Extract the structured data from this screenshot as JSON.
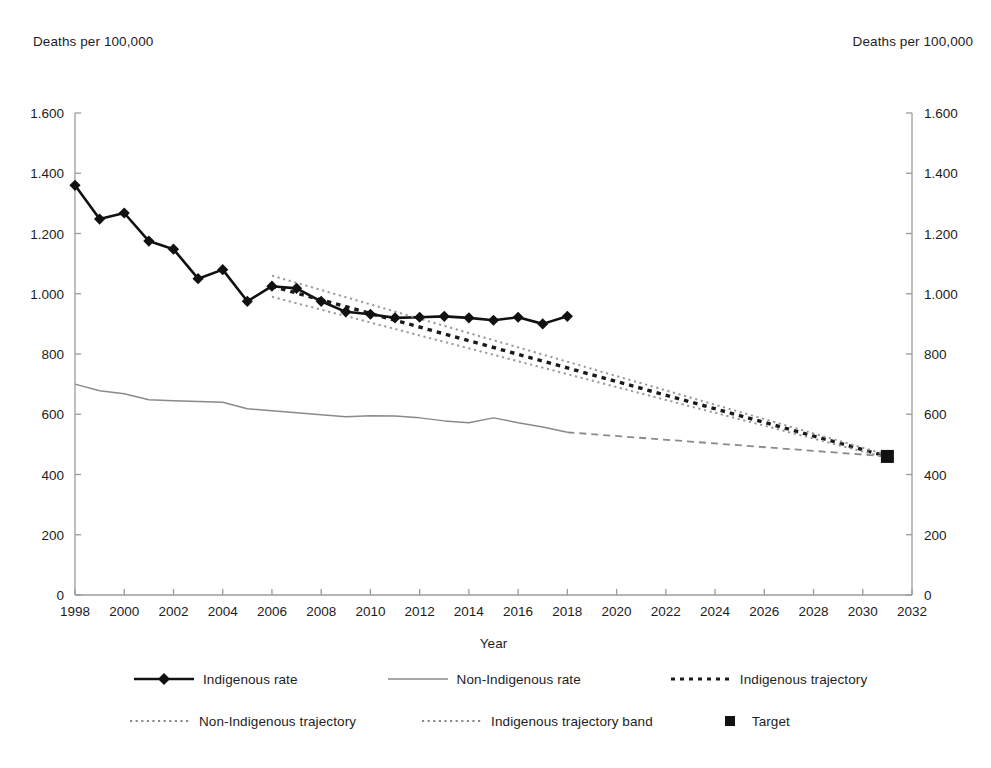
{
  "axis_labels": {
    "left_unit": "Deaths per 100,000",
    "right_unit": "Deaths per 100,000",
    "x_title": "Year"
  },
  "legend": {
    "items": [
      {
        "label": "Indigenous rate",
        "icon": "line-with-diamond-marker",
        "style": "solid-thick-black-diamond"
      },
      {
        "label": "Non-Indigenous rate",
        "icon": "line-gray",
        "style": "solid-thin-gray"
      },
      {
        "label": "Indigenous trajectory",
        "icon": "dashed-line-black",
        "style": "dashed-bold-black"
      },
      {
        "label": "Non-Indigenous trajectory",
        "icon": "dotted-line-gray",
        "style": "dotted-gray"
      },
      {
        "label": "Indigenous trajectory band",
        "icon": "dotted-line-gray",
        "style": "dotted-gray"
      },
      {
        "label": "Target",
        "icon": "square-marker-black",
        "style": "square-black"
      }
    ]
  },
  "colors": {
    "indigenous_rate": "#111111",
    "non_indigenous_rate": "#8a8a8a",
    "indigenous_trajectory": "#1a1a1a",
    "non_indigenous_trajectory": "#8a8a8a",
    "trajectory_band": "#9a9a9a",
    "target": "#111111",
    "axis": "#9b9b9b",
    "text": "#1d1d1d",
    "background": "#ffffff"
  },
  "chart_data": {
    "type": "line",
    "title": "",
    "xlabel": "Year",
    "ylabel": "Deaths per 100,000",
    "ylabel_right": "Deaths per 100,000",
    "xlim": [
      1998,
      2032
    ],
    "ylim": [
      0,
      1600
    ],
    "xticks": [
      1998,
      2000,
      2002,
      2004,
      2006,
      2008,
      2010,
      2012,
      2014,
      2016,
      2018,
      2020,
      2022,
      2024,
      2026,
      2028,
      2030,
      2032
    ],
    "xticklabels": [
      "1998",
      "2000",
      "2002",
      "2004",
      "2006",
      "2008",
      "2010",
      "2012",
      "2014",
      "2016",
      "2018",
      "2020",
      "2022",
      "2024",
      "2026",
      "2028",
      "2030",
      "2032"
    ],
    "yticks": [
      0,
      200,
      400,
      600,
      800,
      1000,
      1200,
      1400,
      1600
    ],
    "yticklabels": [
      "0",
      "200",
      "400",
      "600",
      "800",
      "1.000",
      "1.200",
      "1.400",
      "1.600"
    ],
    "yticklabels_right": [
      "0",
      "200",
      "400",
      "600",
      "800",
      "1.000",
      "1.200",
      "1.400",
      "1.600"
    ],
    "grid": false,
    "legend_position": "below",
    "series": [
      {
        "name": "Indigenous rate",
        "marker": "diamond",
        "linestyle": "solid",
        "color": "#111111",
        "x": [
          1998,
          1999,
          2000,
          2001,
          2002,
          2003,
          2004,
          2005,
          2006,
          2007,
          2008,
          2009,
          2010,
          2011,
          2012,
          2013,
          2014,
          2015,
          2016,
          2017,
          2018
        ],
        "values": [
          1360,
          1248,
          1268,
          1175,
          1148,
          1050,
          1080,
          975,
          1025,
          1018,
          975,
          940,
          932,
          920,
          922,
          925,
          920,
          912,
          922,
          900,
          925
        ]
      },
      {
        "name": "Non-Indigenous rate",
        "marker": "none",
        "linestyle": "solid",
        "color": "#8a8a8a",
        "x": [
          1998,
          1999,
          2000,
          2001,
          2002,
          2003,
          2004,
          2005,
          2006,
          2007,
          2008,
          2009,
          2010,
          2011,
          2012,
          2013,
          2014,
          2015,
          2016,
          2017,
          2018
        ],
        "values": [
          700,
          678,
          668,
          648,
          645,
          642,
          640,
          618,
          612,
          605,
          598,
          592,
          595,
          594,
          588,
          578,
          572,
          588,
          572,
          558,
          540
        ]
      },
      {
        "name": "Indigenous trajectory",
        "marker": "none",
        "linestyle": "dashed",
        "color": "#1a1a1a",
        "x": [
          2006,
          2031
        ],
        "values": [
          1025,
          460
        ]
      },
      {
        "name": "Non-Indigenous trajectory",
        "marker": "none",
        "linestyle": "dashed",
        "color": "#8a8a8a",
        "x": [
          2018,
          2031
        ],
        "values": [
          540,
          460
        ]
      },
      {
        "name": "Indigenous trajectory band upper",
        "marker": "none",
        "linestyle": "dotted",
        "color": "#9a9a9a",
        "x": [
          2006,
          2031
        ],
        "values": [
          1060,
          465
        ]
      },
      {
        "name": "Indigenous trajectory band lower",
        "marker": "none",
        "linestyle": "dotted",
        "color": "#9a9a9a",
        "x": [
          2006,
          2031
        ],
        "values": [
          990,
          455
        ]
      }
    ],
    "annotations": [
      {
        "name": "target-point",
        "x": 2031,
        "y": 460,
        "marker": "square",
        "label": "Target"
      }
    ]
  }
}
